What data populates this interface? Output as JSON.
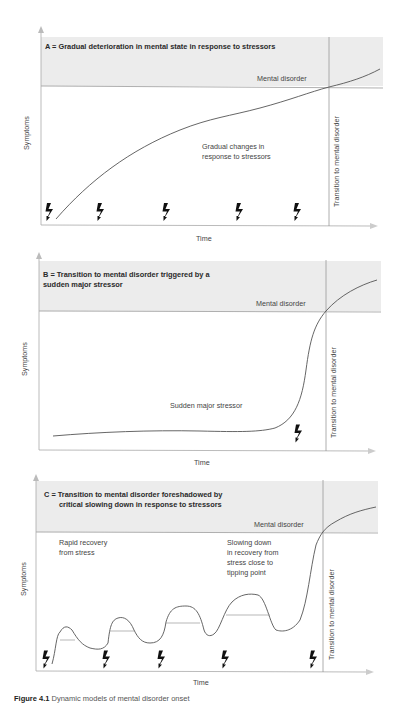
{
  "figure": {
    "caption_label": "Figure 4.1",
    "caption_text": "Dynamic models of mental disorder onset"
  },
  "panels": [
    {
      "id": "A",
      "title_line1": "A = Gradual deterioration in mental state in response to stressors",
      "title_line2": "",
      "threshold_label": "Mental disorder",
      "transition_label": "Transition to mental disorder",
      "y_label": "Symptoms",
      "x_label": "Time",
      "annotations": [
        "Gradual changes in",
        "response to stressors"
      ],
      "stressor_count": 5
    },
    {
      "id": "B",
      "title_line1": "B = Transition to mental disorder triggered by a",
      "title_line2": "sudden major stressor",
      "threshold_label": "Mental disorder",
      "transition_label": "Transition to mental disorder",
      "y_label": "Symptoms",
      "x_label": "Time",
      "annotations": [
        "Sudden major stressor"
      ],
      "stressor_count": 1
    },
    {
      "id": "C",
      "title_line1": "C = Transition to mental disorder foreshadowed by",
      "title_line2": "critical slowing down in response to stressors",
      "threshold_label": "Mental disorder",
      "transition_label": "Transition to mental disorder",
      "y_label": "Symptoms",
      "x_label": "Time",
      "annotation_left": [
        "Rapid recovery",
        "from stress"
      ],
      "annotation_right": [
        "Slowing down",
        "in recovery from",
        "stress close to",
        "tipping point"
      ],
      "stressor_count": 5
    }
  ],
  "colors": {
    "band": "#ececec",
    "axis": "#9a9a9a",
    "curve": "#555555",
    "bolt": "#111111"
  }
}
